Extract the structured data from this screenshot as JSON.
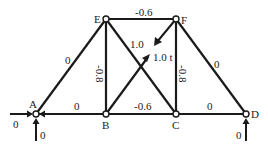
{
  "diagram": {
    "type": "truss",
    "nodes": [
      {
        "id": "A",
        "label": "A"
      },
      {
        "id": "B",
        "label": "B"
      },
      {
        "id": "C",
        "label": "C"
      },
      {
        "id": "D",
        "label": "D"
      },
      {
        "id": "E",
        "label": "E"
      },
      {
        "id": "F",
        "label": "F"
      }
    ],
    "members": [
      {
        "id": "AB",
        "label": "0"
      },
      {
        "id": "BC",
        "label": "-0.6"
      },
      {
        "id": "CD",
        "label": "0"
      },
      {
        "id": "EF",
        "label": "-0.6"
      },
      {
        "id": "AE",
        "label": "0"
      },
      {
        "id": "BE",
        "label": "-0.8"
      },
      {
        "id": "CF",
        "label": "-0.8"
      },
      {
        "id": "EC",
        "label": "1.0"
      },
      {
        "id": "DF",
        "label": "0"
      },
      {
        "id": "BF",
        "label": ""
      }
    ],
    "loads": {
      "unit_load_label": "1.0 t"
    },
    "reactions": {
      "A_horizontal": "0",
      "A_vertical": "0",
      "D_vertical": "0"
    }
  }
}
